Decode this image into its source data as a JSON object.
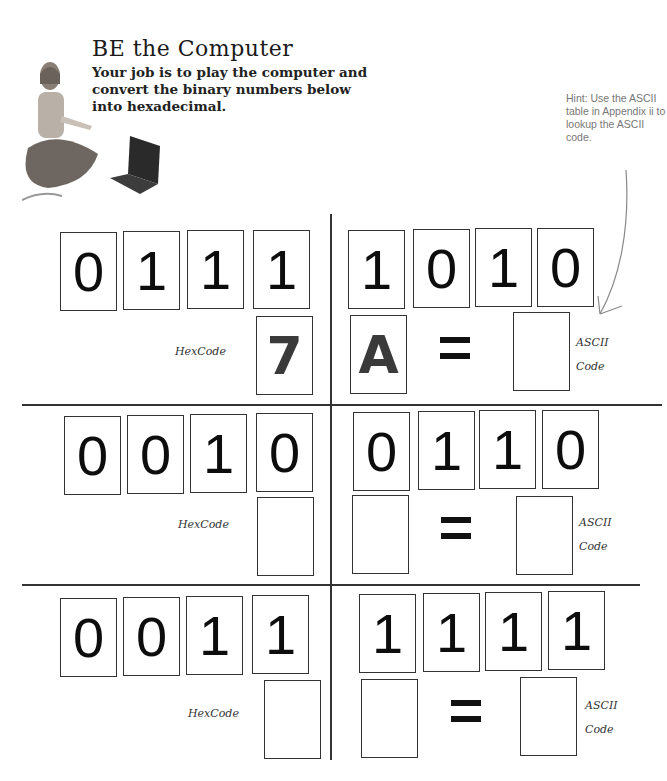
{
  "header": {
    "title": "BE the Computer",
    "intro": "Your job is to play the computer and convert the binary numbers below into hexadecimal.",
    "hint": "Hint: Use the ASCII table in Appendix ii to lookup the ASCII code."
  },
  "labels": {
    "hex": "HexCode",
    "ascii_1": "ASCII",
    "ascii_2": "Code",
    "equals": "="
  },
  "rows": [
    {
      "left_bits": [
        "0",
        "1",
        "1",
        "1"
      ],
      "right_bits": [
        "1",
        "0",
        "1",
        "0"
      ],
      "left_hex": "7",
      "right_hex": "A",
      "ascii": ""
    },
    {
      "left_bits": [
        "0",
        "0",
        "1",
        "0"
      ],
      "right_bits": [
        "0",
        "1",
        "1",
        "0"
      ],
      "left_hex": "",
      "right_hex": "",
      "ascii": ""
    },
    {
      "left_bits": [
        "0",
        "0",
        "1",
        "1"
      ],
      "right_bits": [
        "1",
        "1",
        "1",
        "1"
      ],
      "left_hex": "",
      "right_hex": "",
      "ascii": ""
    }
  ]
}
